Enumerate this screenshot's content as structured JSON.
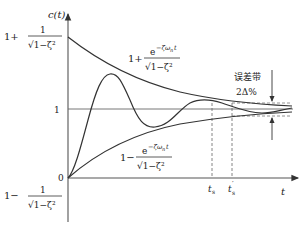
{
  "figure": {
    "type": "second-order underdamped step response with envelope curves",
    "y_axis_label": "c(t)",
    "x_axis_label": "t",
    "origin_label": "0",
    "unit_level_label": "1",
    "upper_left_label": {
      "prefix": "1+",
      "numerator": "1",
      "denominator": "√1−ζ²"
    },
    "lower_left_label": {
      "prefix": "1−",
      "numerator": "1",
      "denominator": "√1−ζ²"
    },
    "upper_envelope_label": {
      "prefix": "1+",
      "numerator": "e^(−ζω_n t)",
      "num_base": "e",
      "num_exp": "−ζω",
      "num_exp_sub": "n",
      "num_exp_t": "t",
      "denominator": "√1−ζ²"
    },
    "lower_envelope_label": {
      "prefix": "1−",
      "numerator": "e^(−ζω_n t)",
      "num_base": "e",
      "num_exp": "−ζω",
      "num_exp_sub": "n",
      "num_exp_t": "t",
      "denominator": "√1−ζ²"
    },
    "error_band_label": "误差带",
    "error_band_value": "2Δ%",
    "ts_label": "t",
    "ts_sub": "s",
    "ts_prime_label": "t",
    "ts_prime_sub": "s",
    "ts_prime_mark": "′",
    "colors": {
      "line": "#333333",
      "axis": "#555555",
      "dashed": "#666666"
    }
  }
}
